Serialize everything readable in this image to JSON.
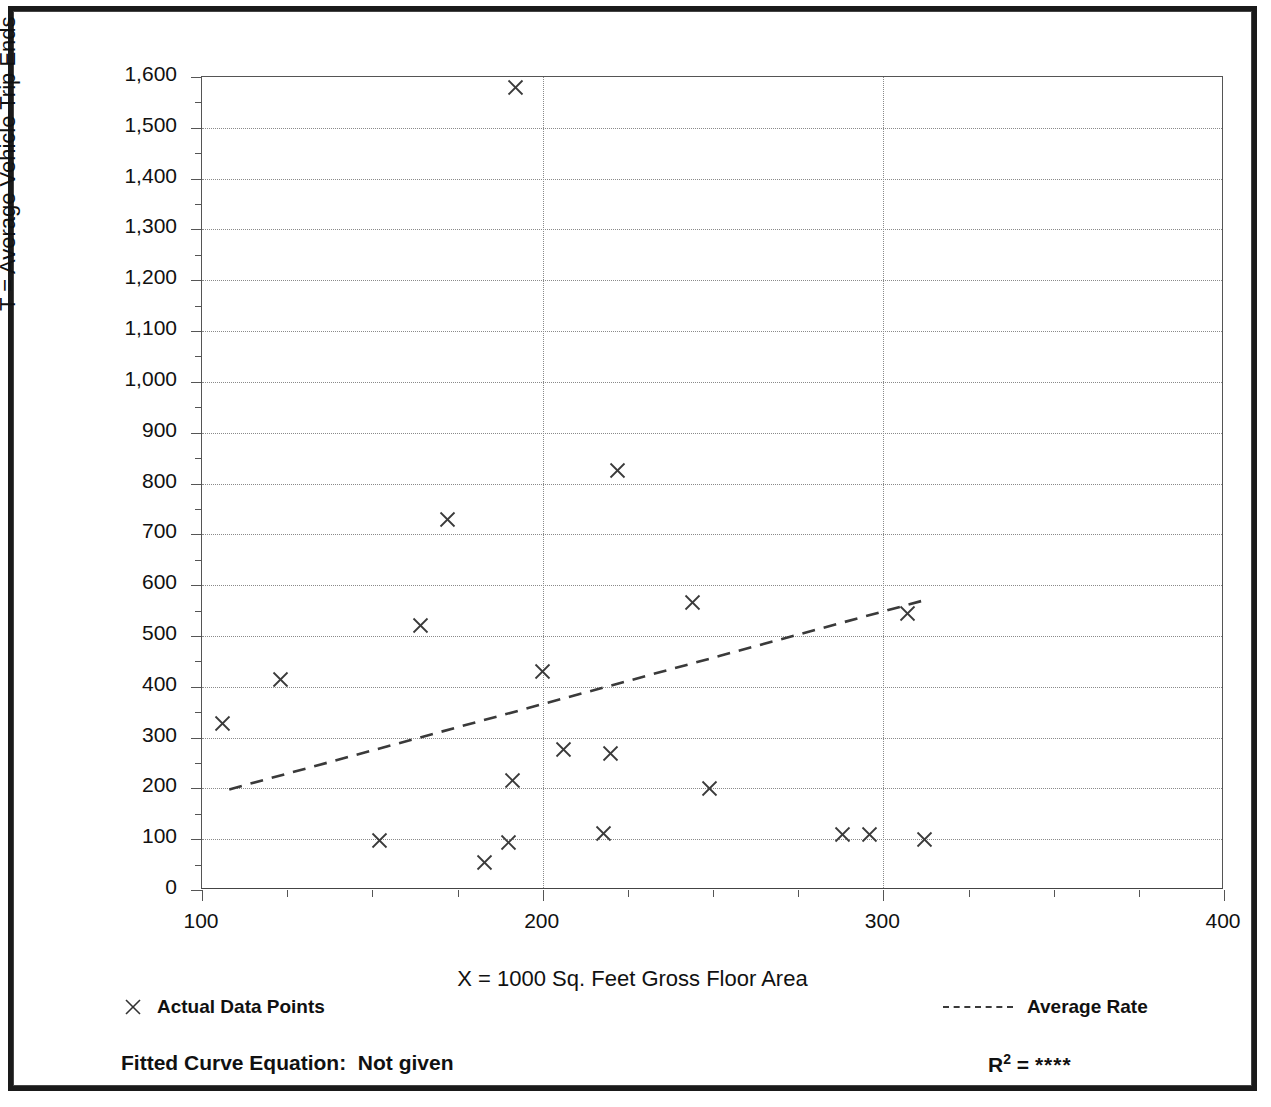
{
  "title": "",
  "footer": {
    "fitted_curve_label": "Fitted Curve Equation:",
    "fitted_curve_value": "Not given",
    "r_squared_label": "R",
    "r_squared_exponent": "2",
    "r_squared_equals": "=",
    "r_squared_value": "****"
  },
  "legend": {
    "points_label": "Actual Data Points",
    "rate_label": "Average Rate",
    "marker_icon": "x-marker-icon",
    "line_icon": "dashed-line-icon"
  },
  "chart_data": {
    "type": "scatter",
    "title": "",
    "xlabel": "X = 1000 Sq. Feet Gross Floor Area",
    "ylabel": "T = Average Vehicle Trip Ends",
    "xlim": [
      100,
      400
    ],
    "ylim": [
      0,
      1600
    ],
    "xticks": [
      100,
      200,
      300,
      400
    ],
    "xtick_labels": [
      "100",
      "200",
      "300",
      "400"
    ],
    "x_minor_step": 25,
    "yticks": [
      0,
      100,
      200,
      300,
      400,
      500,
      600,
      700,
      800,
      900,
      1000,
      1100,
      1200,
      1300,
      1400,
      1500,
      1600
    ],
    "ytick_labels": [
      "0",
      "100",
      "200",
      "300",
      "400",
      "500",
      "600",
      "700",
      "800",
      "900",
      "1,000",
      "1,100",
      "1,200",
      "1,300",
      "1,400",
      "1,500",
      "1,600"
    ],
    "y_minor_step": 50,
    "grid": "dotted horizontal at every 100; dotted vertical at 200 and 300",
    "vertical_gridlines": [
      200,
      300
    ],
    "legend_position": "below-plot",
    "series": [
      {
        "name": "Actual Data Points",
        "marker": "x",
        "points": [
          {
            "x": 106,
            "y": 327
          },
          {
            "x": 123,
            "y": 415
          },
          {
            "x": 152,
            "y": 98
          },
          {
            "x": 164,
            "y": 520
          },
          {
            "x": 172,
            "y": 730
          },
          {
            "x": 183,
            "y": 55
          },
          {
            "x": 190,
            "y": 93
          },
          {
            "x": 191,
            "y": 215
          },
          {
            "x": 192,
            "y": 1580
          },
          {
            "x": 200,
            "y": 430
          },
          {
            "x": 206,
            "y": 277
          },
          {
            "x": 218,
            "y": 112
          },
          {
            "x": 220,
            "y": 268
          },
          {
            "x": 222,
            "y": 825
          },
          {
            "x": 244,
            "y": 565
          },
          {
            "x": 249,
            "y": 200
          },
          {
            "x": 288,
            "y": 110
          },
          {
            "x": 296,
            "y": 110
          },
          {
            "x": 307,
            "y": 545
          },
          {
            "x": 312,
            "y": 100
          }
        ]
      },
      {
        "name": "Average Rate",
        "type": "line",
        "style": "dashed",
        "points": [
          {
            "x": 108,
            "y": 198
          },
          {
            "x": 313,
            "y": 572
          }
        ]
      }
    ]
  }
}
